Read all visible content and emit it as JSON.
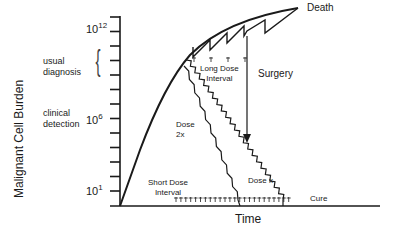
{
  "diagram": {
    "y_axis_label": "Malignant Cell Burden",
    "x_axis_label": "Time",
    "y_ticks": [
      {
        "base": "10",
        "exp": "12"
      },
      {
        "base": "10",
        "exp": "6"
      },
      {
        "base": "10",
        "exp": "1"
      }
    ],
    "annotations": {
      "usual_diagnosis": [
        "usual",
        "diagnosis"
      ],
      "clinical_detection": [
        "clinical",
        "detection"
      ],
      "death": "Death",
      "surgery": "Surgery",
      "long_dose_interval": [
        "Long Dose",
        "Interval"
      ],
      "short_dose_interval": [
        "Short Dose",
        "Interval"
      ],
      "dose_2x": [
        "Dose",
        "2x"
      ],
      "dose_x": "Dose x",
      "cure": "Cure"
    },
    "dose_markers": {
      "long_interval_count": 4,
      "short_interval_count": 24
    }
  }
}
